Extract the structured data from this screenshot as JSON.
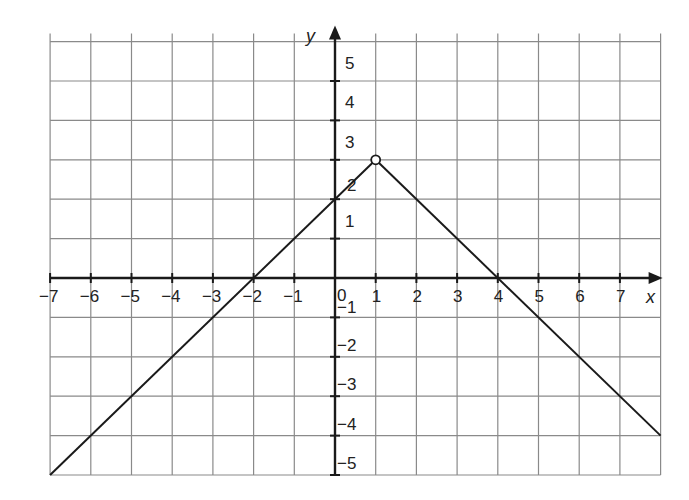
{
  "chart_data": {
    "type": "line",
    "title": "",
    "xlabel": "x",
    "ylabel": "y",
    "xlim": [
      -7,
      8
    ],
    "ylim": [
      -5,
      6
    ],
    "grid": true,
    "legend": null,
    "x_ticks": [
      -7,
      -6,
      -5,
      -4,
      -3,
      -2,
      -1,
      0,
      1,
      2,
      3,
      4,
      5,
      6,
      7
    ],
    "y_ticks": [
      -5,
      -4,
      -3,
      -2,
      -1,
      1,
      2,
      3,
      4,
      5
    ],
    "origin_label": "0",
    "series": [
      {
        "name": "f(x) left branch",
        "x": [
          -7,
          1
        ],
        "y": [
          -5,
          3
        ],
        "style": "solid"
      },
      {
        "name": "f(x) right branch",
        "x": [
          1,
          8
        ],
        "y": [
          3,
          -4
        ],
        "style": "solid"
      }
    ],
    "annotations": [
      {
        "type": "open-circle",
        "x": 1,
        "y": 3
      }
    ],
    "intercepts": {
      "x_intercepts": [
        -2,
        4
      ],
      "y_intercept": 2
    }
  }
}
